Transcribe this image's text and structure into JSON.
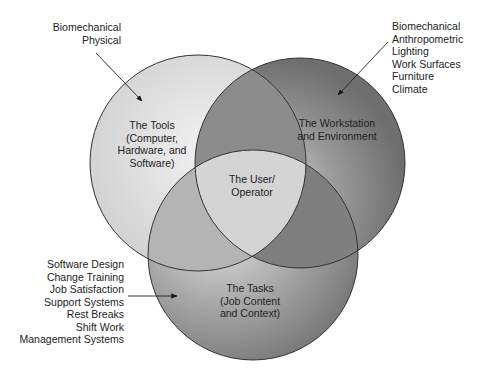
{
  "diagram": {
    "type": "venn",
    "circles": [
      {
        "id": "tools",
        "lines": [
          "The Tools",
          "(Computer,",
          "Hardware, and",
          "Software)"
        ],
        "fill": "#d8d8d8"
      },
      {
        "id": "workstation",
        "lines": [
          "The Workstation",
          "and Environment"
        ],
        "fill": "#8a8a8a"
      },
      {
        "id": "tasks",
        "lines": [
          "The Tasks",
          "(Job Content",
          "and Context)"
        ],
        "fill": "#9a9a9a"
      }
    ],
    "center": {
      "lines": [
        "The User/",
        "Operator"
      ]
    },
    "callouts": {
      "tools": [
        "Biomechanical",
        "Physical"
      ],
      "workstation": [
        "Biomechanical",
        "Anthropometric",
        "Lighting",
        "Work Surfaces",
        "Furniture",
        "Climate"
      ],
      "tasks": [
        "Software Design",
        "Change Training",
        "Job Satisfaction",
        "Support Systems",
        "Rest Breaks",
        "Shift Work",
        "Management Systems"
      ]
    }
  }
}
